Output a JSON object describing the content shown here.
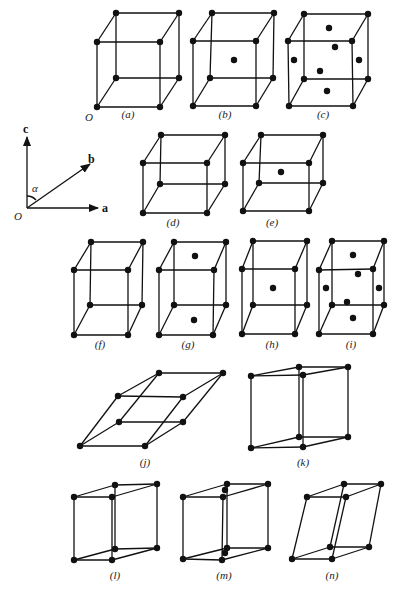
{
  "figure": {
    "axes": {
      "origin_label": "O",
      "a_label": "a",
      "b_label": "b",
      "c_label": "c",
      "angle_label": "α"
    },
    "origin_label_cube_a": "O",
    "cells": [
      {
        "id": "a",
        "label": "(a)",
        "name": "simple cubic",
        "label_pos": [
          128,
          118
        ],
        "v": [
          [
            97,
            107
          ],
          [
            160,
            107
          ],
          [
            179,
            78
          ],
          [
            116,
            78
          ],
          [
            97,
            42
          ],
          [
            160,
            42
          ],
          [
            179,
            13
          ],
          [
            116,
            13
          ]
        ],
        "extra": []
      },
      {
        "id": "b",
        "label": "(b)",
        "name": "body-centred cubic",
        "label_pos": [
          225,
          118
        ],
        "v": [
          [
            193,
            106
          ],
          [
            256,
            106
          ],
          [
            273,
            78
          ],
          [
            210,
            78
          ],
          [
            193,
            41
          ],
          [
            256,
            41
          ],
          [
            274,
            13
          ],
          [
            212,
            13
          ]
        ],
        "extra": [
          [
            234,
            60
          ]
        ]
      },
      {
        "id": "c",
        "label": "(c)",
        "name": "face-centred cubic",
        "label_pos": [
          323,
          118
        ],
        "v": [
          [
            289,
            106
          ],
          [
            353,
            106
          ],
          [
            368,
            79
          ],
          [
            304,
            79
          ],
          [
            288,
            41
          ],
          [
            352,
            41
          ],
          [
            368,
            14
          ],
          [
            304,
            14
          ]
        ],
        "extra": [
          [
            329,
            28
          ],
          [
            335,
            47
          ],
          [
            294,
            60
          ],
          [
            359,
            60
          ],
          [
            320,
            71
          ],
          [
            327,
            91
          ]
        ]
      },
      {
        "id": "d",
        "label": "(d)",
        "name": "simple tetragonal",
        "label_pos": [
          173,
          226
        ],
        "v": [
          [
            143,
            213
          ],
          [
            207,
            213
          ],
          [
            225,
            184
          ],
          [
            160,
            184
          ],
          [
            143,
            163
          ],
          [
            207,
            163
          ],
          [
            225,
            135
          ],
          [
            161,
            135
          ]
        ],
        "extra": []
      },
      {
        "id": "e",
        "label": "(e)",
        "name": "body-centred tetragonal",
        "label_pos": [
          272,
          226
        ],
        "v": [
          [
            243,
            211
          ],
          [
            309,
            211
          ],
          [
            323,
            183
          ],
          [
            259,
            183
          ],
          [
            243,
            163
          ],
          [
            309,
            163
          ],
          [
            323,
            135
          ],
          [
            261,
            135
          ]
        ],
        "extra": [
          [
            281,
            172
          ]
        ]
      },
      {
        "id": "f",
        "label": "(f)",
        "name": "simple orthorhombic",
        "label_pos": [
          100,
          348
        ],
        "v": [
          [
            74,
            335
          ],
          [
            128,
            335
          ],
          [
            142,
            305
          ],
          [
            90,
            305
          ],
          [
            74,
            270
          ],
          [
            128,
            270
          ],
          [
            143,
            242
          ],
          [
            91,
            242
          ]
        ],
        "extra": []
      },
      {
        "id": "g",
        "label": "(g)",
        "name": "base-centred orthorhombic",
        "label_pos": [
          188,
          348
        ],
        "v": [
          [
            159,
            335
          ],
          [
            213,
            335
          ],
          [
            226,
            305
          ],
          [
            174,
            305
          ],
          [
            159,
            270
          ],
          [
            214,
            270
          ],
          [
            226,
            242
          ],
          [
            174,
            242
          ]
        ],
        "extra": [
          [
            195,
            256
          ],
          [
            194,
            320
          ]
        ]
      },
      {
        "id": "h",
        "label": "(h)",
        "name": "body-centred orthorhombic",
        "label_pos": [
          272,
          348
        ],
        "v": [
          [
            242,
            334
          ],
          [
            295,
            334
          ],
          [
            307,
            305
          ],
          [
            253,
            305
          ],
          [
            242,
            269
          ],
          [
            295,
            269
          ],
          [
            307,
            241
          ],
          [
            253,
            241
          ]
        ],
        "extra": [
          [
            273,
            288
          ]
        ]
      },
      {
        "id": "i",
        "label": "(i)",
        "name": "face-centred orthorhombic",
        "label_pos": [
          351,
          348
        ],
        "v": [
          [
            319,
            334
          ],
          [
            373,
            334
          ],
          [
            384,
            305
          ],
          [
            332,
            305
          ],
          [
            319,
            270
          ],
          [
            373,
            269
          ],
          [
            384,
            241
          ],
          [
            332,
            241
          ]
        ],
        "extra": [
          [
            353,
            255
          ],
          [
            358,
            274
          ],
          [
            326,
            288
          ],
          [
            379,
            288
          ],
          [
            347,
            302
          ],
          [
            353,
            318
          ]
        ]
      },
      {
        "id": "j",
        "label": "(j)",
        "name": "rhombohedral",
        "label_pos": [
          145,
          466
        ],
        "v": [
          [
            80,
            446
          ],
          [
            145,
            446
          ],
          [
            183,
            422
          ],
          [
            119,
            422
          ],
          [
            118,
            396
          ],
          [
            183,
            397
          ],
          [
            223,
            373
          ],
          [
            159,
            373
          ]
        ],
        "extra": []
      },
      {
        "id": "k",
        "label": "(k)",
        "name": "hexagonal",
        "label_pos": [
          303,
          466
        ],
        "v": [
          [
            251,
            448
          ],
          [
            303,
            447
          ],
          [
            348,
            437
          ],
          [
            299,
            437
          ],
          [
            251,
            376
          ],
          [
            303,
            375
          ],
          [
            348,
            367
          ],
          [
            299,
            367
          ]
        ],
        "extra": []
      },
      {
        "id": "l",
        "label": "(l)",
        "name": "simple monoclinic",
        "label_pos": [
          115,
          579
        ],
        "v": [
          [
            74,
            560
          ],
          [
            112,
            560
          ],
          [
            157,
            548
          ],
          [
            115,
            549
          ],
          [
            74,
            497
          ],
          [
            112,
            497
          ],
          [
            157,
            484
          ],
          [
            115,
            485
          ]
        ],
        "extra": []
      },
      {
        "id": "m",
        "label": "(m)",
        "name": "base-centred monoclinic",
        "label_pos": [
          224,
          579
        ],
        "v": [
          [
            183,
            559
          ],
          [
            222,
            560
          ],
          [
            268,
            548
          ],
          [
            227,
            548
          ],
          [
            183,
            497
          ],
          [
            223,
            497
          ],
          [
            268,
            484
          ],
          [
            227,
            484
          ]
        ],
        "extra": [
          [
            225,
            490
          ],
          [
            225,
            553
          ]
        ]
      },
      {
        "id": "n",
        "label": "(n)",
        "name": "triclinic",
        "label_pos": [
          332,
          579
        ],
        "v": [
          [
            292,
            559
          ],
          [
            332,
            559
          ],
          [
            369,
            547
          ],
          [
            330,
            547
          ],
          [
            307,
            497
          ],
          [
            346,
            497
          ],
          [
            381,
            484
          ],
          [
            344,
            484
          ]
        ],
        "extra": []
      }
    ]
  }
}
